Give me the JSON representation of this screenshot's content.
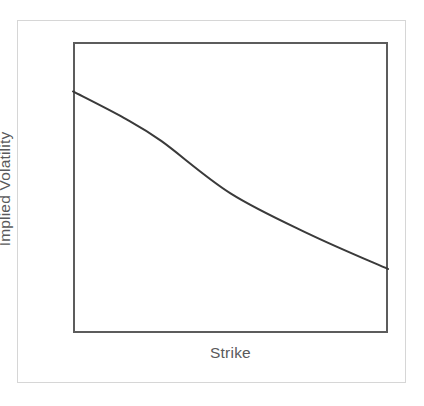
{
  "chart_data": {
    "type": "line",
    "title": "",
    "subtitle": "",
    "xlabel": "Strike",
    "ylabel": "Implied Volatility",
    "legend": [],
    "legend_position": "none",
    "grid": false,
    "xticks": [],
    "yticks": [],
    "xlim": [
      0,
      1
    ],
    "ylim": [
      0,
      1
    ],
    "annotations": [],
    "series": [
      {
        "name": "implied-volatility-skew",
        "color": "#3a3a3a",
        "line_width": 2,
        "x": [
          0.0,
          0.16,
          0.28,
          0.5,
          0.75,
          1.0
        ],
        "y": [
          0.83,
          0.74,
          0.66,
          0.48,
          0.34,
          0.22
        ]
      }
    ]
  },
  "axes": {
    "x_title": "Strike",
    "y_title": "Implied Volatility"
  },
  "style": {
    "outer_frame_color": "#d6d6d6",
    "plot_border_color": "#5c5c5c",
    "curve_color": "#3a3a3a",
    "label_color": "#59595b",
    "background_color": "#ffffff"
  }
}
